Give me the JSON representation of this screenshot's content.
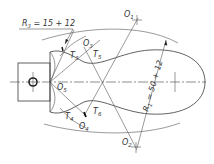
{
  "diagram": {
    "type": "engineering-construction-drawing",
    "stroke_color": "#3a3a3a",
    "background": "#ffffff",
    "dimensions": {
      "r3": {
        "symbol": "R",
        "sub": "3",
        "text": " = 15 + 12"
      },
      "r1": {
        "symbol": "R",
        "sub": "1",
        "text": " = 50 + 12"
      }
    },
    "centers": [
      {
        "id": "O1",
        "symbol": "O",
        "sub": "1"
      },
      {
        "id": "O2",
        "symbol": "O",
        "sub": "2"
      },
      {
        "id": "O3",
        "symbol": "O",
        "sub": "3"
      },
      {
        "id": "O4",
        "symbol": "O",
        "sub": "4"
      },
      {
        "id": "O5",
        "symbol": "O",
        "sub": "5"
      }
    ],
    "tangent_points": [
      {
        "id": "T3",
        "symbol": "T",
        "sub": "3"
      },
      {
        "id": "T4",
        "symbol": "T",
        "sub": "4"
      },
      {
        "id": "T5",
        "symbol": "T",
        "sub": "5"
      },
      {
        "id": "T6",
        "symbol": "T",
        "sub": "6"
      }
    ]
  }
}
